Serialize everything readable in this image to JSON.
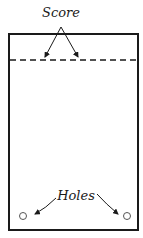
{
  "diagram": {
    "labels": {
      "score": "Score",
      "holes": "Holes"
    },
    "colors": {
      "stroke": "#1a1a1a",
      "background": "#ffffff"
    }
  }
}
